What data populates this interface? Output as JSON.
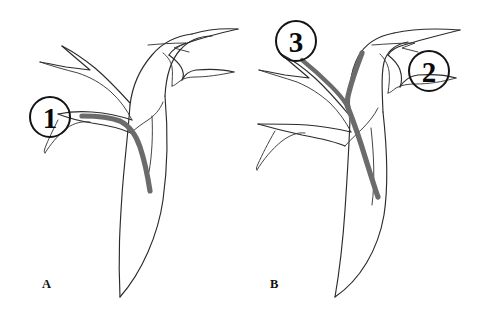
{
  "figure": {
    "width": 487,
    "height": 317,
    "background_color": "#ffffff",
    "outline_color": "#2b2b2b",
    "device_color": "#6b6b6b",
    "callout_color": "#141414"
  },
  "panels": [
    {
      "id": "panel-a",
      "letter": "A",
      "letter_x": 42,
      "letter_y": 288,
      "callouts": [
        {
          "id": "callout-1",
          "label": "1",
          "cx": 50,
          "cy": 117,
          "r": 20
        }
      ],
      "device": {
        "name": "device-overlay-a",
        "description": "gray device line running from the left side branch through the curve into the descending trunk"
      }
    },
    {
      "id": "panel-b",
      "letter": "B",
      "letter_x": 270,
      "letter_y": 288,
      "callouts": [
        {
          "id": "callout-3",
          "label": "3",
          "cx": 296,
          "cy": 41,
          "r": 20
        },
        {
          "id": "callout-2",
          "label": "2",
          "cx": 429,
          "cy": 71,
          "r": 20
        }
      ],
      "device": {
        "name": "device-overlay-b",
        "description": "gray Y-shaped device: one limb from the upper-left branch and one from the upper-right branch, merging into the descending trunk"
      }
    }
  ]
}
